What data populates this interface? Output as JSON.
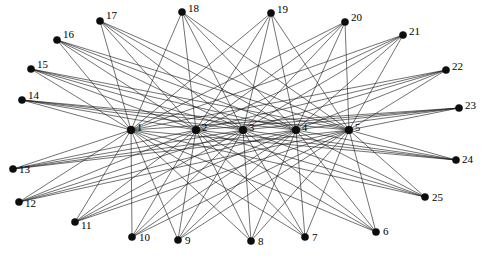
{
  "figure": {
    "type": "graph-diagram",
    "title": "",
    "width": 485,
    "height": 257,
    "background_color": "#ffffff",
    "edge_color": "#1a1a1a",
    "node_color": "#0d0d0d",
    "label_color": "#000000",
    "node_radius": 3.6,
    "hub_node_radius": 3.9,
    "edge_width": 0.62
  },
  "graph_data": {
    "type": "bipartite",
    "hub_count": 5,
    "peripheral_count": 20,
    "edge_count": 100,
    "hub_nodes": [
      {
        "id": "1",
        "label": "1",
        "x": 131,
        "y": 130,
        "label_dx": 6,
        "label_dy": -1
      },
      {
        "id": "2",
        "label": "2",
        "x": 196,
        "y": 130,
        "label_dx": 6,
        "label_dy": -1
      },
      {
        "id": "3",
        "label": "3",
        "x": 243,
        "y": 130,
        "label_dx": 6,
        "label_dy": -1
      },
      {
        "id": "4",
        "label": "4",
        "x": 296,
        "y": 130,
        "label_dx": 6,
        "label_dy": -1
      },
      {
        "id": "5",
        "label": "5",
        "x": 349,
        "y": 130,
        "label_dx": 6,
        "label_dy": -1
      }
    ],
    "peripheral_nodes": [
      {
        "id": "6",
        "label": "6",
        "x": 376,
        "y": 232,
        "label_dx": 7,
        "label_dy": 0
      },
      {
        "id": "7",
        "label": "7",
        "x": 305,
        "y": 237,
        "label_dx": 7,
        "label_dy": 1
      },
      {
        "id": "8",
        "label": "8",
        "x": 251,
        "y": 241,
        "label_dx": 7,
        "label_dy": 1
      },
      {
        "id": "9",
        "label": "9",
        "x": 178,
        "y": 240,
        "label_dx": 7,
        "label_dy": 1
      },
      {
        "id": "10",
        "label": "10",
        "x": 132,
        "y": 237,
        "label_dx": 7,
        "label_dy": 1
      },
      {
        "id": "11",
        "label": "11",
        "x": 75,
        "y": 222,
        "label_dx": 6,
        "label_dy": 4
      },
      {
        "id": "12",
        "label": "12",
        "x": 19,
        "y": 202,
        "label_dx": 6,
        "label_dy": 2
      },
      {
        "id": "13",
        "label": "13",
        "x": 13,
        "y": 169,
        "label_dx": 6,
        "label_dy": 1
      },
      {
        "id": "14",
        "label": "14",
        "x": 22,
        "y": 100,
        "label_dx": 6,
        "label_dy": -4
      },
      {
        "id": "15",
        "label": "15",
        "x": 31,
        "y": 69,
        "label_dx": 6,
        "label_dy": -4
      },
      {
        "id": "16",
        "label": "16",
        "x": 57,
        "y": 40,
        "label_dx": 6,
        "label_dy": -5
      },
      {
        "id": "17",
        "label": "17",
        "x": 100,
        "y": 21,
        "label_dx": 6,
        "label_dy": -5
      },
      {
        "id": "18",
        "label": "18",
        "x": 182,
        "y": 12,
        "label_dx": 6,
        "label_dy": -3
      },
      {
        "id": "19",
        "label": "19",
        "x": 271,
        "y": 13,
        "label_dx": 6,
        "label_dy": -3
      },
      {
        "id": "20",
        "label": "20",
        "x": 345,
        "y": 22,
        "label_dx": 6,
        "label_dy": -4
      },
      {
        "id": "21",
        "label": "21",
        "x": 403,
        "y": 35,
        "label_dx": 6,
        "label_dy": -3
      },
      {
        "id": "22",
        "label": "22",
        "x": 446,
        "y": 70,
        "label_dx": 6,
        "label_dy": -3
      },
      {
        "id": "23",
        "label": "23",
        "x": 459,
        "y": 108,
        "label_dx": 6,
        "label_dy": -2
      },
      {
        "id": "24",
        "label": "24",
        "x": 456,
        "y": 160,
        "label_dx": 6,
        "label_dy": 0
      },
      {
        "id": "25",
        "label": "25",
        "x": 425,
        "y": 197,
        "label_dx": 7,
        "label_dy": 1
      }
    ],
    "edges": [
      [
        "6",
        "1"
      ],
      [
        "6",
        "2"
      ],
      [
        "6",
        "3"
      ],
      [
        "6",
        "4"
      ],
      [
        "6",
        "5"
      ],
      [
        "7",
        "1"
      ],
      [
        "7",
        "2"
      ],
      [
        "7",
        "3"
      ],
      [
        "7",
        "4"
      ],
      [
        "7",
        "5"
      ],
      [
        "8",
        "1"
      ],
      [
        "8",
        "2"
      ],
      [
        "8",
        "3"
      ],
      [
        "8",
        "4"
      ],
      [
        "8",
        "5"
      ],
      [
        "9",
        "1"
      ],
      [
        "9",
        "2"
      ],
      [
        "9",
        "3"
      ],
      [
        "9",
        "4"
      ],
      [
        "9",
        "5"
      ],
      [
        "10",
        "1"
      ],
      [
        "10",
        "2"
      ],
      [
        "10",
        "3"
      ],
      [
        "10",
        "4"
      ],
      [
        "10",
        "5"
      ],
      [
        "11",
        "1"
      ],
      [
        "11",
        "2"
      ],
      [
        "11",
        "3"
      ],
      [
        "11",
        "4"
      ],
      [
        "11",
        "5"
      ],
      [
        "12",
        "1"
      ],
      [
        "12",
        "2"
      ],
      [
        "12",
        "3"
      ],
      [
        "12",
        "4"
      ],
      [
        "12",
        "5"
      ],
      [
        "13",
        "1"
      ],
      [
        "13",
        "2"
      ],
      [
        "13",
        "3"
      ],
      [
        "13",
        "4"
      ],
      [
        "13",
        "5"
      ],
      [
        "14",
        "1"
      ],
      [
        "14",
        "2"
      ],
      [
        "14",
        "3"
      ],
      [
        "14",
        "4"
      ],
      [
        "14",
        "5"
      ],
      [
        "15",
        "1"
      ],
      [
        "15",
        "2"
      ],
      [
        "15",
        "3"
      ],
      [
        "15",
        "4"
      ],
      [
        "15",
        "5"
      ],
      [
        "16",
        "1"
      ],
      [
        "16",
        "2"
      ],
      [
        "16",
        "3"
      ],
      [
        "16",
        "4"
      ],
      [
        "16",
        "5"
      ],
      [
        "17",
        "1"
      ],
      [
        "17",
        "2"
      ],
      [
        "17",
        "3"
      ],
      [
        "17",
        "4"
      ],
      [
        "17",
        "5"
      ],
      [
        "18",
        "1"
      ],
      [
        "18",
        "2"
      ],
      [
        "18",
        "3"
      ],
      [
        "18",
        "4"
      ],
      [
        "18",
        "5"
      ],
      [
        "19",
        "1"
      ],
      [
        "19",
        "2"
      ],
      [
        "19",
        "3"
      ],
      [
        "19",
        "4"
      ],
      [
        "19",
        "5"
      ],
      [
        "20",
        "1"
      ],
      [
        "20",
        "2"
      ],
      [
        "20",
        "3"
      ],
      [
        "20",
        "4"
      ],
      [
        "20",
        "5"
      ],
      [
        "21",
        "1"
      ],
      [
        "21",
        "2"
      ],
      [
        "21",
        "3"
      ],
      [
        "21",
        "4"
      ],
      [
        "21",
        "5"
      ],
      [
        "22",
        "1"
      ],
      [
        "22",
        "2"
      ],
      [
        "22",
        "3"
      ],
      [
        "22",
        "4"
      ],
      [
        "22",
        "5"
      ],
      [
        "23",
        "1"
      ],
      [
        "23",
        "2"
      ],
      [
        "23",
        "3"
      ],
      [
        "23",
        "4"
      ],
      [
        "23",
        "5"
      ],
      [
        "24",
        "1"
      ],
      [
        "24",
        "2"
      ],
      [
        "24",
        "3"
      ],
      [
        "24",
        "4"
      ],
      [
        "24",
        "5"
      ],
      [
        "25",
        "1"
      ],
      [
        "25",
        "2"
      ],
      [
        "25",
        "3"
      ],
      [
        "25",
        "4"
      ],
      [
        "25",
        "5"
      ]
    ]
  }
}
